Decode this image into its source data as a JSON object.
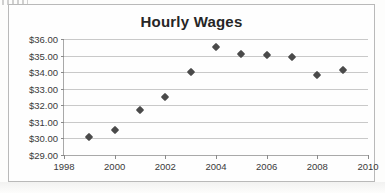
{
  "chart_data": {
    "type": "scatter",
    "title": "Hourly Wages",
    "xlabel": "",
    "ylabel": "",
    "x": [
      1999,
      2000,
      2001,
      2002,
      2003,
      2004,
      2005,
      2006,
      2007,
      2008,
      2009
    ],
    "values": [
      30.1,
      30.5,
      31.7,
      32.5,
      34.0,
      35.5,
      35.1,
      35.05,
      34.9,
      33.8,
      34.15
    ],
    "series": [
      {
        "name": "Hourly Wages",
        "values": [
          30.1,
          30.5,
          31.7,
          32.5,
          34.0,
          35.5,
          35.1,
          35.05,
          34.9,
          33.8,
          34.15
        ]
      }
    ],
    "xlim": [
      1998,
      2010
    ],
    "ylim": [
      29.0,
      36.0
    ],
    "x_ticks": [
      1998,
      2000,
      2002,
      2004,
      2006,
      2008,
      2010
    ],
    "x_tick_labels": [
      "1998",
      "2000",
      "2002",
      "2004",
      "2006",
      "2008",
      "2010"
    ],
    "y_ticks": [
      29.0,
      30.0,
      31.0,
      32.0,
      33.0,
      34.0,
      35.0,
      36.0
    ],
    "y_tick_labels": [
      "$29.00",
      "$30.00",
      "$31.00",
      "$32.00",
      "$33.00",
      "$34.00",
      "$35.00",
      "$36.00"
    ],
    "grid": "horizontal",
    "legend": "none",
    "marker": "diamond",
    "marker_color": "#4a4a4a",
    "gridline_color": "#c9c9c9",
    "axis_color": "#a9a9a9",
    "plot_background": "#fefefe"
  }
}
